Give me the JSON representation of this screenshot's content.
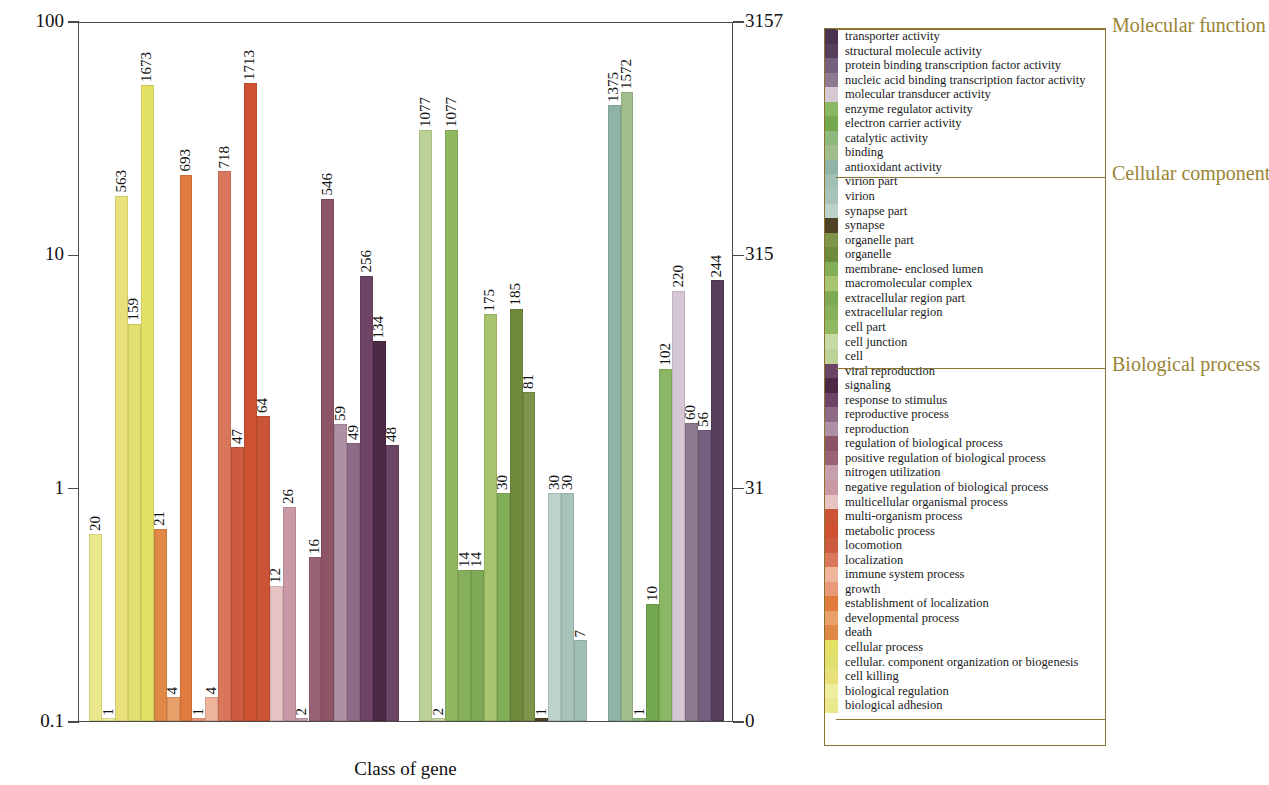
{
  "axes": {
    "ylabel_left": "Percent of genes(%)",
    "ylabel_right": "Number of genes(#)",
    "xlabel": "Class of gene",
    "yticks_left": [
      "100",
      "10",
      "1",
      "0.1"
    ],
    "yticks_right": [
      "3157",
      "315",
      "31",
      "0"
    ]
  },
  "legend": {
    "headings": {
      "molecular_function": "Molecular function",
      "cellular_component": "Cellular component",
      "biological_process": "Biological process"
    },
    "heading_color": "#9a8436",
    "border_color": "#8a7430"
  },
  "chart_data": {
    "type": "bar",
    "title": "",
    "xlabel": "Class of gene",
    "ylabel": "Percent of genes(%)",
    "ylabel_secondary": "Number of genes(#)",
    "yscale": "log",
    "ylim": [
      0.1,
      100
    ],
    "ylim_secondary": [
      0,
      3157
    ],
    "ytick_labels": [
      "100",
      "10",
      "1",
      "0.1"
    ],
    "ytick_labels_secondary": [
      "3157",
      "315",
      "31",
      "0"
    ],
    "grid": false,
    "legend_position": "right",
    "total_genes": 3157,
    "groups": [
      {
        "name": "Biological process",
        "color_head": "#9a8436",
        "categories": [
          {
            "label": "biological adhesion",
            "value": 20,
            "percent": 0.633,
            "color": "#eae88c"
          },
          {
            "label": "biological regulation",
            "value": 1,
            "percent": 0.032,
            "color": "#efeda0"
          },
          {
            "label": "cell killing",
            "value": 563,
            "percent": 17.83,
            "color": "#e8e07a"
          },
          {
            "label": "cellular. component organization or biogenesis",
            "value": 159,
            "percent": 5.04,
            "color": "#dfe06f"
          },
          {
            "label": "cellular process",
            "value": 1673,
            "percent": 52.99,
            "color": "#e3e267"
          },
          {
            "label": "death",
            "value": 21,
            "percent": 0.665,
            "color": "#e08845"
          },
          {
            "label": "developmental process",
            "value": 4,
            "percent": 0.127,
            "color": "#e9a06a"
          },
          {
            "label": "establishment of localization",
            "value": 693,
            "percent": 21.95,
            "color": "#e07a3d"
          },
          {
            "label": "growth",
            "value": 1,
            "percent": 0.032,
            "color": "#e89a78"
          },
          {
            "label": "immune system process",
            "value": 4,
            "percent": 0.127,
            "color": "#eeb49c"
          },
          {
            "label": "localization",
            "value": 718,
            "percent": 22.74,
            "color": "#d9765c"
          },
          {
            "label": "locomotion",
            "value": 47,
            "percent": 1.49,
            "color": "#cc5b3f"
          },
          {
            "label": "metabolic process",
            "value": 1713,
            "percent": 54.26,
            "color": "#cf5132"
          },
          {
            "label": "multi-organism process",
            "value": 64,
            "percent": 2.03,
            "color": "#cc5436"
          },
          {
            "label": "multicellular organismal process",
            "value": 12,
            "percent": 0.38,
            "color": "#e7c3c3"
          },
          {
            "label": "negative regulation of biological process",
            "value": 26,
            "percent": 0.824,
            "color": "#c99aa6"
          },
          {
            "label": "nitrogen utilization",
            "value": 2,
            "percent": 0.063,
            "color": "#c7a0ae"
          },
          {
            "label": "positive regulation of biological process",
            "value": 16,
            "percent": 0.507,
            "color": "#9a6276"
          },
          {
            "label": "regulation of biological process",
            "value": 546,
            "percent": 17.29,
            "color": "#8d5367"
          },
          {
            "label": "reproduction",
            "value": 59,
            "percent": 1.87,
            "color": "#ae90a4"
          },
          {
            "label": "reproductive process",
            "value": 49,
            "percent": 1.55,
            "color": "#8d6b86"
          },
          {
            "label": "response to stimulus",
            "value": 256,
            "percent": 8.11,
            "color": "#6e4466"
          },
          {
            "label": "signaling",
            "value": 134,
            "percent": 4.24,
            "color": "#4c2a45"
          },
          {
            "label": "viral reproduction",
            "value": 48,
            "percent": 1.52,
            "color": "#6b4566"
          }
        ]
      },
      {
        "name": "Cellular component",
        "categories": [
          {
            "label": "cell",
            "value": 1077,
            "percent": 34.11,
            "color": "#bcd296"
          },
          {
            "label": "cell junction",
            "value": 2,
            "percent": 0.063,
            "color": "#c7d9a4"
          },
          {
            "label": "cell part",
            "value": 1077,
            "percent": 34.11,
            "color": "#8fb860"
          },
          {
            "label": "extracellular region",
            "value": 14,
            "percent": 0.443,
            "color": "#86b05a"
          },
          {
            "label": "extracellular region part",
            "value": 14,
            "percent": 0.443,
            "color": "#7faa55"
          },
          {
            "label": "macromolecular complex",
            "value": 175,
            "percent": 5.54,
            "color": "#a7c46e"
          },
          {
            "label": "membrane- enclosed lumen",
            "value": 30,
            "percent": 0.95,
            "color": "#83ae58"
          },
          {
            "label": "organelle",
            "value": 185,
            "percent": 5.86,
            "color": "#6e8a3c"
          },
          {
            "label": "organelle part",
            "value": 81,
            "percent": 2.57,
            "color": "#7d944a"
          },
          {
            "label": "synapse",
            "value": 1,
            "percent": 0.032,
            "color": "#4f4226"
          },
          {
            "label": "synapse part",
            "value": 30,
            "percent": 0.95,
            "color": "#bdd2c8"
          },
          {
            "label": "virion",
            "value": 30,
            "percent": 0.95,
            "color": "#a8c4ba"
          },
          {
            "label": "virion part",
            "value": 7,
            "percent": 0.222,
            "color": "#a2bfb3"
          }
        ]
      },
      {
        "name": "Molecular function",
        "categories": [
          {
            "label": "antioxidant activity",
            "value": 1375,
            "percent": 43.55,
            "color": "#8fb3a6"
          },
          {
            "label": "binding",
            "value": 1572,
            "percent": 49.79,
            "color": "#9fbe8c"
          },
          {
            "label": "catalytic activity",
            "value": 1,
            "percent": 0.032,
            "color": "#8fb87c"
          },
          {
            "label": "electron carrier activity",
            "value": 10,
            "percent": 0.317,
            "color": "#73a84f"
          },
          {
            "label": "enzyme  regulator activity",
            "value": 102,
            "percent": 3.23,
            "color": "#8ab763"
          },
          {
            "label": "molecular transducer activity",
            "value": 220,
            "percent": 6.97,
            "color": "#d6c7d4"
          },
          {
            "label": "nucleic acid binding transcription factor activity",
            "value": 60,
            "percent": 1.9,
            "color": "#8d7a90"
          },
          {
            "label": "protein binding  transcription factor activity",
            "value": 56,
            "percent": 1.77,
            "color": "#766080"
          },
          {
            "label": "structural molecule activity",
            "value": 244,
            "percent": 7.73,
            "color": "#553f5c"
          },
          {
            "label": "transporter activity",
            "value": 0,
            "percent": 0,
            "color": "#4a3350"
          }
        ]
      }
    ],
    "legend_groups": [
      {
        "heading": "Molecular function",
        "items": [
          {
            "label": "transporter activity",
            "color": "#4a3350"
          },
          {
            "label": "structural molecule activity",
            "color": "#553f5c"
          },
          {
            "label": "protein binding  transcription factor activity",
            "color": "#766080"
          },
          {
            "label": "nucleic acid binding transcription factor activity",
            "color": "#8d7a90"
          },
          {
            "label": "molecular transducer activity",
            "color": "#d6c7d4"
          },
          {
            "label": "enzyme  regulator activity",
            "color": "#8ab763"
          },
          {
            "label": "electron carrier activity",
            "color": "#73a84f"
          },
          {
            "label": "catalytic activity",
            "color": "#8fb87c"
          },
          {
            "label": "binding",
            "color": "#9fbe8c"
          },
          {
            "label": "antioxidant activity",
            "color": "#8fb3a6"
          }
        ]
      },
      {
        "heading": "Cellular component",
        "items": [
          {
            "label": "virion part",
            "color": "#a2bfb3"
          },
          {
            "label": "virion",
            "color": "#a8c4ba"
          },
          {
            "label": "synapse part",
            "color": "#bdd2c8"
          },
          {
            "label": "synapse",
            "color": "#4f4226"
          },
          {
            "label": "organelle part",
            "color": "#7d944a"
          },
          {
            "label": "organelle",
            "color": "#6e8a3c"
          },
          {
            "label": "membrane- enclosed lumen",
            "color": "#83ae58"
          },
          {
            "label": "macromolecular complex",
            "color": "#a7c46e"
          },
          {
            "label": "extracellular region part",
            "color": "#7faa55"
          },
          {
            "label": "extracellular region",
            "color": "#86b05a"
          },
          {
            "label": "cell part",
            "color": "#8fb860"
          },
          {
            "label": "cell junction",
            "color": "#c7d9a4"
          },
          {
            "label": "cell",
            "color": "#bcd296"
          }
        ]
      },
      {
        "heading": "Biological process",
        "items": [
          {
            "label": "viral reproduction",
            "color": "#6b4566"
          },
          {
            "label": "signaling",
            "color": "#4c2a45"
          },
          {
            "label": "response to stimulus",
            "color": "#6e4466"
          },
          {
            "label": "reproductive process",
            "color": "#8d6b86"
          },
          {
            "label": "reproduction",
            "color": "#ae90a4"
          },
          {
            "label": "regulation of biological process",
            "color": "#8d5367"
          },
          {
            "label": "positive regulation of biological process",
            "color": "#9a6276"
          },
          {
            "label": "nitrogen utilization",
            "color": "#c7a0ae"
          },
          {
            "label": "negative regulation of biological process",
            "color": "#c99aa6"
          },
          {
            "label": "multicellular organismal process",
            "color": "#e7c3c3"
          },
          {
            "label": "multi-organism process",
            "color": "#cc5436"
          },
          {
            "label": "metabolic process",
            "color": "#cf5132"
          },
          {
            "label": "locomotion",
            "color": "#cc5b3f"
          },
          {
            "label": "localization",
            "color": "#d9765c"
          },
          {
            "label": "immune system process",
            "color": "#eeb49c"
          },
          {
            "label": "growth",
            "color": "#e89a78"
          },
          {
            "label": "establishment of localization",
            "color": "#e07a3d"
          },
          {
            "label": "developmental process",
            "color": "#e9a06a"
          },
          {
            "label": "death",
            "color": "#e08845"
          },
          {
            "label": "cellular process",
            "color": "#e3e267"
          },
          {
            "label": "cellular. component organization or biogenesis",
            "color": "#dfe06f"
          },
          {
            "label": "cell killing",
            "color": "#e8e07a"
          },
          {
            "label": "biological regulation",
            "color": "#efeda0"
          },
          {
            "label": "biological adhesion",
            "color": "#eae88c"
          }
        ]
      }
    ],
    "bar_sequence": [
      {
        "label": "biological adhesion",
        "value": 20,
        "color": "#eae88c",
        "group": "bp"
      },
      {
        "label": "biological regulation",
        "value": 1,
        "color": "#efeda0",
        "group": "bp"
      },
      {
        "label": "cell killing",
        "value": 563,
        "color": "#e8e07a",
        "group": "bp"
      },
      {
        "label": "cellular. component organization or biogenesis",
        "value": 159,
        "color": "#dfe06f",
        "group": "bp"
      },
      {
        "label": "cellular process",
        "value": 1673,
        "color": "#e3e267",
        "group": "bp"
      },
      {
        "label": "death",
        "value": 21,
        "color": "#e08845",
        "group": "bp"
      },
      {
        "label": "developmental process",
        "value": 4,
        "color": "#e9a06a",
        "group": "bp"
      },
      {
        "label": "establishment of localization",
        "value": 693,
        "color": "#e07a3d",
        "group": "bp"
      },
      {
        "label": "growth",
        "value": 1,
        "color": "#e89a78",
        "group": "bp"
      },
      {
        "label": "immune system process",
        "value": 4,
        "color": "#eeb49c",
        "group": "bp"
      },
      {
        "label": "localization",
        "value": 718,
        "color": "#d9765c",
        "group": "bp"
      },
      {
        "label": "locomotion",
        "value": 47,
        "color": "#cc5b3f",
        "group": "bp"
      },
      {
        "label": "metabolic process",
        "value": 1713,
        "color": "#cf5132",
        "group": "bp"
      },
      {
        "label": "multi-organism process",
        "value": 64,
        "color": "#cc5436",
        "group": "bp"
      },
      {
        "label": "multicellular organismal process",
        "value": 12,
        "color": "#e7c3c3",
        "group": "bp"
      },
      {
        "label": "negative regulation of biological process",
        "value": 26,
        "color": "#c99aa6",
        "group": "bp"
      },
      {
        "label": "nitrogen utilization",
        "value": 2,
        "color": "#c7a0ae",
        "group": "bp"
      },
      {
        "label": "positive regulation of biological process",
        "value": 16,
        "color": "#9a6276",
        "group": "bp"
      },
      {
        "label": "regulation of biological process",
        "value": 546,
        "color": "#8d5367",
        "group": "bp"
      },
      {
        "label": "reproduction",
        "value": 59,
        "color": "#ae90a4",
        "group": "bp"
      },
      {
        "label": "reproductive process",
        "value": 49,
        "color": "#8d6b86",
        "group": "bp"
      },
      {
        "label": "response to stimulus",
        "value": 256,
        "color": "#6e4466",
        "group": "bp"
      },
      {
        "label": "signaling",
        "value": 134,
        "color": "#4c2a45",
        "group": "bp"
      },
      {
        "label": "viral reproduction",
        "value": 48,
        "color": "#6b4566",
        "group": "bp"
      },
      {
        "label": "cell",
        "value": 1077,
        "color": "#bcd296",
        "group": "cc"
      },
      {
        "label": "cell junction",
        "value": 2,
        "color": "#c7d9a4",
        "group": "cc"
      },
      {
        "label": "cell part",
        "value": 1077,
        "color": "#8fb860",
        "group": "cc"
      },
      {
        "label": "extracellular region",
        "value": 14,
        "color": "#86b05a",
        "group": "cc"
      },
      {
        "label": "extracellular region part",
        "value": 14,
        "color": "#7faa55",
        "group": "cc"
      },
      {
        "label": "macromolecular complex",
        "value": 175,
        "color": "#a7c46e",
        "group": "cc"
      },
      {
        "label": "membrane- enclosed lumen",
        "value": 30,
        "color": "#83ae58",
        "group": "cc"
      },
      {
        "label": "organelle",
        "value": 185,
        "color": "#6e8a3c",
        "group": "cc"
      },
      {
        "label": "organelle part",
        "value": 81,
        "color": "#7d944a",
        "group": "cc"
      },
      {
        "label": "synapse",
        "value": 1,
        "color": "#4f4226",
        "group": "cc"
      },
      {
        "label": "synapse part",
        "value": 30,
        "color": "#bdd2c8",
        "group": "cc"
      },
      {
        "label": "virion",
        "value": 30,
        "color": "#a8c4ba",
        "group": "cc"
      },
      {
        "label": "virion part",
        "value": 7,
        "color": "#a2bfb3",
        "group": "cc"
      },
      {
        "label": "antioxidant activity",
        "value": 1375,
        "color": "#8fb3a6",
        "group": "mf"
      },
      {
        "label": "binding",
        "value": 1572,
        "color": "#9fbe8c",
        "group": "mf"
      },
      {
        "label": "catalytic activity",
        "value": 1,
        "color": "#8fb87c",
        "group": "mf"
      },
      {
        "label": "electron carrier activity",
        "value": 10,
        "color": "#73a84f",
        "group": "mf"
      },
      {
        "label": "enzyme  regulator activity",
        "value": 102,
        "color": "#8ab763",
        "group": "mf"
      },
      {
        "label": "molecular transducer activity",
        "value": 220,
        "color": "#d6c7d4",
        "group": "mf"
      },
      {
        "label": "nucleic acid binding transcription factor activity",
        "value": 60,
        "color": "#8d7a90",
        "group": "mf"
      },
      {
        "label": "protein binding  transcription factor activity",
        "value": 56,
        "color": "#766080",
        "group": "mf"
      },
      {
        "label": "structural molecule activity",
        "value": 244,
        "color": "#553f5c",
        "group": "mf"
      }
    ]
  }
}
